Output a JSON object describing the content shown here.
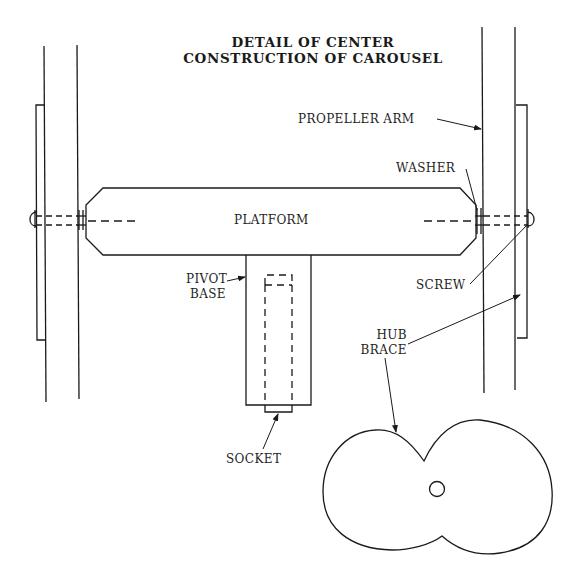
{
  "title": {
    "line1": "DETAIL OF CENTER",
    "line2": "CONSTRUCTION OF CAROUSEL"
  },
  "labels": {
    "propeller_arm": "PROPELLER ARM",
    "washer": "WASHER",
    "platform": "PLATFORM",
    "pivot": "PIVOT",
    "base": "BASE",
    "screw": "SCREW",
    "hub": "HUB",
    "brace": "BRACE",
    "socket": "SOCKET"
  },
  "colors": {
    "line": "#1a1a1a",
    "background": "#ffffff"
  }
}
